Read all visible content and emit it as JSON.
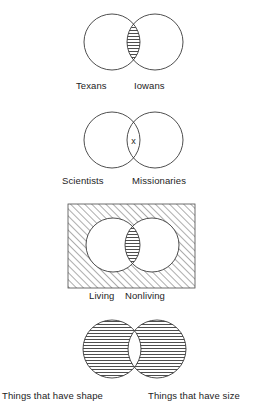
{
  "figure": {
    "background_color": "#ffffff",
    "stroke_color": "#3a3a3a",
    "hatch_color": "#4a4a4a",
    "diagrams": [
      {
        "id": "texans-iowans",
        "index": 1,
        "shading": "intersection",
        "hatch_style": "horizontal",
        "mark": "",
        "universe_box": false,
        "left_label": "Texans",
        "right_label": "Iowans"
      },
      {
        "id": "scientists-missionaries",
        "index": 2,
        "shading": "none",
        "hatch_style": "none",
        "mark": "x",
        "mark_location": "intersection",
        "universe_box": false,
        "left_label": "Scientists",
        "right_label": "Missionaries"
      },
      {
        "id": "living-nonliving",
        "index": 3,
        "shading": "intersection-and-universe",
        "hatch_style": "horizontal-lens-diagonal-box",
        "mark": "",
        "universe_box": true,
        "left_label": "Living",
        "right_label": "Nonliving"
      },
      {
        "id": "shape-size",
        "index": 4,
        "shading": "symmetric-difference",
        "hatch_style": "horizontal",
        "mark": "",
        "universe_box": false,
        "left_label": "Things that have shape",
        "right_label": "Things that have size"
      }
    ]
  }
}
